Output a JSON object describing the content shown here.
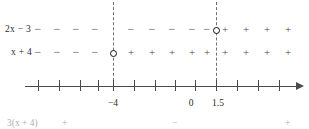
{
  "figure": {
    "type": "sign-chart-number-line",
    "rows": [
      {
        "label": "2x − 3",
        "label_parts": {
          "coefficient_var": "2x",
          "operator": "−",
          "constant": "3"
        },
        "zero_at": 1.5,
        "zero_marker": "open-circle",
        "signs": [
          {
            "symbol": "−",
            "x": 38
          },
          {
            "symbol": "−",
            "x": 57
          },
          {
            "symbol": "−",
            "x": 76
          },
          {
            "symbol": "−",
            "x": 95
          },
          {
            "symbol": "−",
            "x": 131
          },
          {
            "symbol": "−",
            "x": 152
          },
          {
            "symbol": "−",
            "x": 172
          },
          {
            "symbol": "−",
            "x": 192
          },
          {
            "symbol": "−",
            "x": 207
          },
          {
            "symbol": "+",
            "x": 225
          },
          {
            "symbol": "+",
            "x": 246
          },
          {
            "symbol": "+",
            "x": 267
          },
          {
            "symbol": "+",
            "x": 288
          }
        ]
      },
      {
        "label": "x + 4",
        "label_parts": {
          "coefficient_var": "x",
          "operator": "+",
          "constant": "4"
        },
        "zero_at": -4,
        "zero_marker": "open-circle",
        "signs": [
          {
            "symbol": "−",
            "x": 38
          },
          {
            "symbol": "−",
            "x": 57
          },
          {
            "symbol": "−",
            "x": 76
          },
          {
            "symbol": "−",
            "x": 95
          },
          {
            "symbol": "+",
            "x": 131
          },
          {
            "symbol": "+",
            "x": 152
          },
          {
            "symbol": "+",
            "x": 172
          },
          {
            "symbol": "+",
            "x": 192
          },
          {
            "symbol": "+",
            "x": 207
          },
          {
            "symbol": "+",
            "x": 225
          },
          {
            "symbol": "+",
            "x": 246
          },
          {
            "symbol": "+",
            "x": 267
          },
          {
            "symbol": "+",
            "x": 288
          }
        ]
      }
    ],
    "guides": [
      {
        "at_label": "-4",
        "x": 113
      },
      {
        "at_label": "1.5",
        "x": 216
      }
    ],
    "circles": [
      {
        "row": "2x - 3",
        "x": 216,
        "y": 30.5
      },
      {
        "row": "x + 4",
        "x": 113,
        "y": 53.5
      }
    ],
    "axis": {
      "x_start": 25,
      "x_end": 297,
      "arrow": "right",
      "ticks": [
        {
          "x": 38
        },
        {
          "x": 59
        },
        {
          "x": 80
        },
        {
          "x": 98
        },
        {
          "x": 113
        },
        {
          "x": 134
        },
        {
          "x": 155
        },
        {
          "x": 175
        },
        {
          "x": 195
        },
        {
          "x": 216
        },
        {
          "x": 237
        },
        {
          "x": 258
        },
        {
          "x": 279
        }
      ],
      "tick_labels": [
        {
          "text": "−4",
          "x": 113
        },
        {
          "text": "0",
          "x": 191
        },
        {
          "text": "1.5",
          "x": 218
        }
      ]
    },
    "bottom_clipped_row": {
      "label": "3(x + 4)",
      "signs": [
        {
          "symbol": "+",
          "x": 62
        },
        {
          "symbol": "−",
          "x": 172
        },
        {
          "symbol": "+",
          "x": 285
        }
      ]
    },
    "colors": {
      "ink": "#1a1a1a",
      "axis": "#4a4a4a",
      "sign": "#4a4a4a",
      "guide": "#6f6f6f",
      "background": "#ffffff"
    }
  }
}
